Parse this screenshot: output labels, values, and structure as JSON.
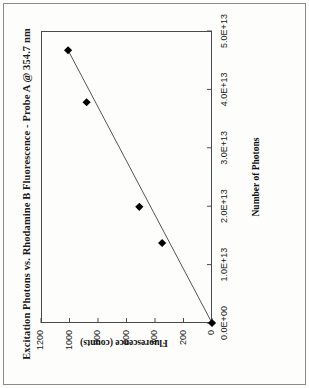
{
  "figure": {
    "rotation_note": "chart rendered rotated 90 degrees counter-clockwise",
    "title": "Excitation Photons vs. Rhodamine B Fluorescence - Probe A @ 354.7 nm"
  },
  "chart_data": {
    "type": "scatter",
    "title": "Excitation Photons vs. Rhodamine B Fluorescence - Probe A @ 354.7 nm",
    "xlabel": "Number of Photons",
    "ylabel": "Fluorescence (counts)",
    "xlim": [
      0,
      50000000000000
    ],
    "ylim": [
      0,
      1200
    ],
    "grid": false,
    "legend": false,
    "xticks": [
      0,
      10000000000000,
      20000000000000,
      30000000000000,
      40000000000000,
      50000000000000
    ],
    "xtick_labels": [
      "0.0E+00",
      "1.0E+13",
      "2.0E+13",
      "3.0E+13",
      "4.0E+13",
      "5.0E+13"
    ],
    "yticks": [
      0,
      200,
      400,
      600,
      800,
      1000,
      1200
    ],
    "ytick_labels": [
      "0",
      "200",
      "400",
      "600",
      "800",
      "1000",
      "1200"
    ],
    "series": [
      {
        "name": "Probe A",
        "marker": "filled-diamond",
        "color": "#000000",
        "x": [
          0,
          13700000000000,
          19900000000000,
          37800000000000,
          46700000000000
        ],
        "y": [
          0,
          350,
          510,
          880,
          1010
        ]
      },
      {
        "name": "linear fit",
        "type": "line",
        "color": "#555555",
        "x": [
          0,
          46700000000000
        ],
        "y": [
          0,
          1010
        ]
      }
    ]
  }
}
